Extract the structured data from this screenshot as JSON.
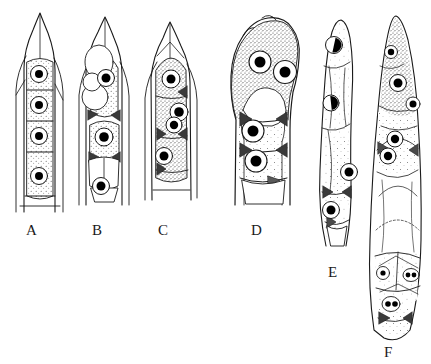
{
  "figure": {
    "title": "",
    "domain_kind": "scientific-line-drawing",
    "background_color": "#ffffff",
    "ink_color": "#1a1a1a",
    "nucleus_fill": "#000000",
    "nucleus_ring_fill": "#ffffff",
    "cytoplasm_stipple_color": "#555555",
    "septum_shade": "#4a4a4a",
    "panel_count": 6
  },
  "labels": [
    {
      "text": "A",
      "x": 26,
      "y": 222
    },
    {
      "text": "B",
      "x": 92,
      "y": 222
    },
    {
      "text": "C",
      "x": 158,
      "y": 222
    },
    {
      "text": "D",
      "x": 251,
      "y": 222
    },
    {
      "text": "E",
      "x": 328,
      "y": 264
    },
    {
      "text": "F",
      "x": 384,
      "y": 344
    }
  ],
  "specimens": [
    {
      "id": "A",
      "name": "specimen-a",
      "description": "Narrow cylindrical cell with pointed apex and four stacked stippled cells, each with one central nucleus",
      "apex_shape": "pointed",
      "cell_count": 4,
      "nuclei_count": 4,
      "nuclei_per_cell": 1,
      "nuclei": [
        {
          "cx": 39,
          "cy": 74,
          "r": 8.5,
          "dot_r": 4.0
        },
        {
          "cx": 39,
          "cy": 105,
          "r": 8.5,
          "dot_r": 4.0
        },
        {
          "cx": 39,
          "cy": 136,
          "r": 8.5,
          "dot_r": 4.0
        },
        {
          "cx": 39,
          "cy": 176,
          "r": 8.5,
          "dot_r": 4.0
        }
      ]
    },
    {
      "id": "B",
      "name": "specimen-b",
      "description": "Cell with large clear vacuole at apex, paired overlapping vesicles with a single nucleus, dark triangular septal clamps",
      "apex_shape": "pointed",
      "cell_count": 4,
      "nuclei_count": 3,
      "nuclei": [
        {
          "cx": 106,
          "cy": 78,
          "r": 8.5,
          "dot_r": 4.5
        },
        {
          "cx": 104,
          "cy": 137,
          "r": 9.0,
          "dot_r": 4.8
        },
        {
          "cx": 101,
          "cy": 186,
          "r": 8.5,
          "dot_r": 4.5
        }
      ],
      "vacuoles": [
        {
          "cx": 99,
          "cy": 62,
          "rx": 14,
          "ry": 17
        },
        {
          "cx": 95,
          "cy": 97,
          "rx": 13,
          "ry": 13
        },
        {
          "cx": 92,
          "cy": 82,
          "rx": 9,
          "ry": 9
        }
      ]
    },
    {
      "id": "C",
      "name": "specimen-c",
      "description": "Densely stippled cell with four offset nuclei and dark arrowhead septa along the right wall",
      "apex_shape": "pointed",
      "cell_count": 4,
      "nuclei_count": 4,
      "nuclei": [
        {
          "cx": 171,
          "cy": 79,
          "r": 9.0,
          "dot_r": 4.5
        },
        {
          "cx": 179,
          "cy": 112,
          "r": 9.0,
          "dot_r": 4.8
        },
        {
          "cx": 174,
          "cy": 125,
          "r": 8.0,
          "dot_r": 4.2
        },
        {
          "cx": 164,
          "cy": 156,
          "r": 8.5,
          "dot_r": 4.5
        }
      ]
    },
    {
      "id": "D",
      "name": "specimen-d",
      "description": "Swollen lobed apical cell, heavily stippled, with two large adjacent nuclei at the head and two stacked nuclei below",
      "apex_shape": "bulbous-lobed",
      "cell_count": 3,
      "nuclei_count": 4,
      "nuclei": [
        {
          "cx": 260,
          "cy": 62,
          "r": 11.0,
          "dot_r": 5.5
        },
        {
          "cx": 285,
          "cy": 72,
          "r": 11.5,
          "dot_r": 5.5
        },
        {
          "cx": 253,
          "cy": 131,
          "r": 11.0,
          "dot_r": 5.5
        },
        {
          "cx": 256,
          "cy": 161,
          "r": 11.0,
          "dot_r": 5.5
        }
      ]
    },
    {
      "id": "E",
      "name": "specimen-e",
      "description": "Slender sinuous cell, lightly stippled, with three nuclei; upper two partly filled crescent-style",
      "apex_shape": "tapered-curved",
      "cell_count": 4,
      "nuclei_count": 3,
      "nuclei": [
        {
          "cx": 334,
          "cy": 45,
          "r": 8.5,
          "dot_r": 4.2,
          "style": "half"
        },
        {
          "cx": 331,
          "cy": 103,
          "r": 8.0,
          "dot_r": 4.0,
          "style": "half"
        },
        {
          "cx": 349,
          "cy": 172,
          "r": 8.5,
          "dot_r": 4.5,
          "style": "full"
        },
        {
          "cx": 331,
          "cy": 210,
          "r": 8.5,
          "dot_r": 4.5,
          "style": "full"
        }
      ]
    },
    {
      "id": "F",
      "name": "specimen-f",
      "description": "Longest cell spanning full figure height; stippled tapered apex with several nuclei, clear mid region, and polygonal basal cells containing small nuclei including one doubled pair",
      "apex_shape": "tapered",
      "cell_count": 7,
      "nuclei_count": 7,
      "nuclei": [
        {
          "cx": 391,
          "cy": 52,
          "r": 6.5,
          "dot_r": 3.2
        },
        {
          "cx": 398,
          "cy": 83,
          "r": 8.5,
          "dot_r": 4.5
        },
        {
          "cx": 413,
          "cy": 104,
          "r": 7.0,
          "dot_r": 3.5
        },
        {
          "cx": 395,
          "cy": 139,
          "r": 8.0,
          "dot_r": 4.2
        },
        {
          "cx": 388,
          "cy": 156,
          "r": 8.0,
          "dot_r": 4.2
        },
        {
          "cx": 383,
          "cy": 273,
          "r": 6.5,
          "dot_r": 2.6
        },
        {
          "cx": 411,
          "cy": 275,
          "r": 7.0,
          "dot_r": 2.6,
          "style": "double"
        },
        {
          "cx": 391,
          "cy": 304,
          "r": 7.5,
          "dot_r": 3.0,
          "style": "double"
        }
      ]
    }
  ]
}
